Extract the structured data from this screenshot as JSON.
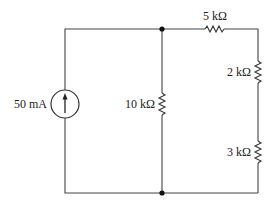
{
  "diagram": {
    "type": "electrical-circuit",
    "components": {
      "current_source": {
        "label": "50 mA",
        "direction": "up"
      },
      "r_shunt": {
        "label": "10 kΩ"
      },
      "r_top": {
        "label": "5 kΩ"
      },
      "r_right_upper": {
        "label": "2 kΩ"
      },
      "r_right_lower": {
        "label": "3 kΩ"
      }
    },
    "nodes": [
      {
        "name": "top-node"
      },
      {
        "name": "bottom-node"
      }
    ]
  }
}
